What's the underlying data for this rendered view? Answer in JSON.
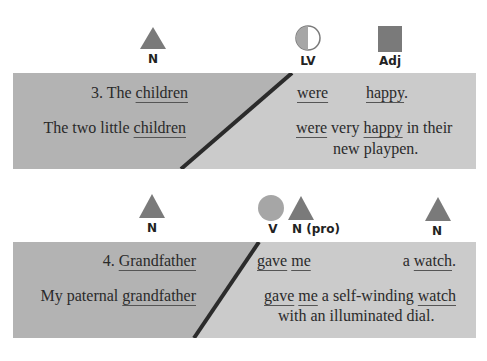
{
  "colors": {
    "left_panel": "#b3b3b3",
    "right_panel": "#cbcbcb",
    "divider": "#2b2b2b",
    "shape_fill": "#7a7a7a",
    "circle_fill": "#a6a6a6"
  },
  "example3": {
    "labels": [
      {
        "icon": "triangle",
        "text": "N"
      },
      {
        "icon": "half-circle",
        "text": "LV"
      },
      {
        "icon": "square",
        "text": "Adj"
      }
    ],
    "number": "3.",
    "left_line1": {
      "pre": "3. The ",
      "head": "children"
    },
    "left_line2": {
      "pre": "The two little ",
      "head": "children"
    },
    "right_line1": {
      "w1": "were",
      "w2": "happy",
      "post": "."
    },
    "right_line2": {
      "w1": "were",
      "mid": " very ",
      "w2": "happy",
      "post": " in their"
    },
    "right_line3": "new playpen."
  },
  "example4": {
    "labels": [
      {
        "icon": "triangle",
        "text": "N"
      },
      {
        "icon": "circle",
        "text": "V"
      },
      {
        "icon": "triangle",
        "text": "N (pro)"
      },
      {
        "icon": "triangle",
        "text": "N"
      }
    ],
    "left_line1": {
      "pre": "4. ",
      "head": "Grandfather"
    },
    "left_line2": {
      "pre": "My paternal ",
      "head": "grandfather"
    },
    "right_line1": {
      "w1": "gave",
      "w2": "me",
      "pre3": "a ",
      "w3": "watch",
      "post": "."
    },
    "right_line2": {
      "w1": "gave",
      "w2": "me",
      "mid": " a self-winding ",
      "w3": "watch"
    },
    "right_line3": "with an illuminated dial."
  }
}
